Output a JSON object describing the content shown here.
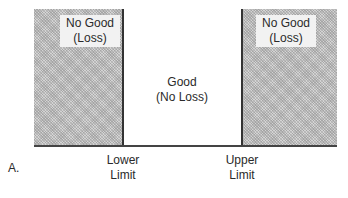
{
  "diagram": {
    "panel_label": "A.",
    "regions": [
      {
        "name": "left",
        "line1": "No Good",
        "line2": "(Loss)",
        "shaded": true
      },
      {
        "name": "middle",
        "line1": "Good",
        "line2": "(No Loss)",
        "shaded": false
      },
      {
        "name": "right",
        "line1": "No Good",
        "line2": "(Loss)",
        "shaded": true
      }
    ],
    "limits": [
      {
        "line1": "Lower",
        "line2": "Limit"
      },
      {
        "line1": "Upper",
        "line2": "Limit"
      }
    ],
    "colors": {
      "shade": "#d4d4d4",
      "line": "#333333"
    }
  }
}
